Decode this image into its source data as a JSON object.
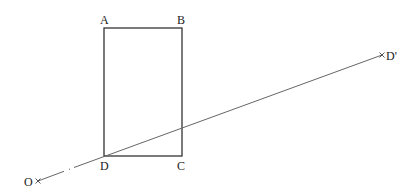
{
  "diagram": {
    "labels": {
      "A": "A",
      "B": "B",
      "C": "C",
      "D": "D",
      "O": "O",
      "D_prime": "D'"
    },
    "points": {
      "A": [
        104,
        28
      ],
      "B": [
        182,
        28
      ],
      "C": [
        182,
        156
      ],
      "D": [
        104,
        156
      ],
      "O": [
        38,
        181
      ],
      "D_prime": [
        382,
        55
      ]
    },
    "colors": {
      "rectangle": "#333333",
      "ray": "#666666",
      "text": "#222222"
    }
  }
}
